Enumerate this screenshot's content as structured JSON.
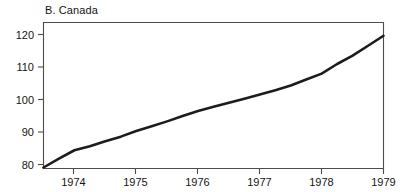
{
  "chart_data": {
    "type": "line",
    "title": "B. Canada",
    "xlabel": "",
    "ylabel": "",
    "xlim": [
      1973.5,
      1979.0
    ],
    "ylim": [
      80,
      124
    ],
    "grid": false,
    "legend": null,
    "x_ticks": [
      "1974",
      "1975",
      "1976",
      "1977",
      "1978",
      "1979"
    ],
    "x_tick_values": [
      1974,
      1975,
      1976,
      1977,
      1978,
      1979
    ],
    "y_ticks": [
      "80",
      "90",
      "100",
      "110",
      "120"
    ],
    "y_tick_values": [
      80,
      90,
      100,
      110,
      120
    ],
    "series": [
      {
        "name": "Canada",
        "color": "#1c1c1c",
        "x": [
          1973.5,
          1973.75,
          1974.0,
          1974.25,
          1974.5,
          1974.75,
          1975.0,
          1975.25,
          1975.5,
          1975.75,
          1976.0,
          1976.25,
          1976.5,
          1976.75,
          1977.0,
          1977.25,
          1977.5,
          1977.75,
          1978.0,
          1978.25,
          1978.5,
          1978.75,
          1979.0
        ],
        "values": [
          80.3,
          83.0,
          85.5,
          86.7,
          88.2,
          89.6,
          91.3,
          92.7,
          94.2,
          95.8,
          97.3,
          98.6,
          99.8,
          101.0,
          102.3,
          103.6,
          105.0,
          106.8,
          108.6,
          111.5,
          114.0,
          117.0,
          120.0
        ],
        "values_at_ticks": {
          "1974": 85.5,
          "1975": 91.3,
          "1976": 97.3,
          "1977": 102.3,
          "1978": 108.6,
          "1979": 123.0
        }
      }
    ],
    "annotations": []
  },
  "axis_colors": {
    "frame": "#4d4d4d",
    "tick": "#4d4d4d",
    "text": "#141414",
    "background": "#ffffff"
  }
}
